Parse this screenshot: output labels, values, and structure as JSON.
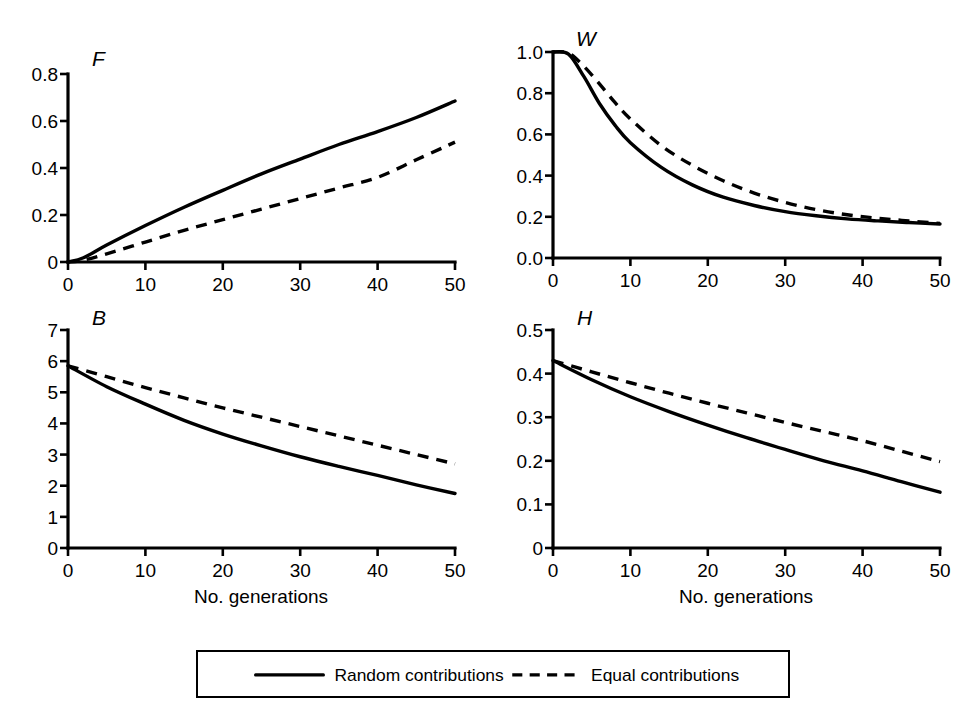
{
  "figure": {
    "background": "#ffffff",
    "ink_color": "#000000",
    "xlabel": "No. generations"
  },
  "legend": {
    "entries": [
      {
        "label": "Random contributions",
        "style": "solid",
        "marker": "solid-line-swatch"
      },
      {
        "label": "Equal contributions",
        "style": "dashed",
        "marker": "dashed-line-swatch"
      }
    ]
  },
  "chart_data": [
    {
      "id": "panel-F",
      "type": "line",
      "title": "F",
      "panel_letter": "F",
      "xlabel": "",
      "ylabel": "",
      "xlim": [
        0,
        50
      ],
      "ylim": [
        0,
        0.8
      ],
      "xticks": [
        0,
        10,
        20,
        30,
        40,
        50
      ],
      "yticks": [
        0,
        0.2,
        0.4,
        0.6,
        0.8
      ],
      "xticklabels": [
        "0",
        "10",
        "20",
        "30",
        "40",
        "50"
      ],
      "yticklabels": [
        "0",
        "0.2",
        "0.4",
        "0.6",
        "0.8"
      ],
      "grid": false,
      "legend_position": "below-figure",
      "x": [
        0,
        2,
        5,
        10,
        15,
        20,
        25,
        30,
        35,
        40,
        45,
        50
      ],
      "series": [
        {
          "name": "Random contributions",
          "style": "solid",
          "values": [
            0.0,
            0.018,
            0.072,
            0.155,
            0.233,
            0.305,
            0.375,
            0.438,
            0.5,
            0.555,
            0.615,
            0.685
          ]
        },
        {
          "name": "Equal contributions",
          "style": "dashed",
          "values": [
            0.0,
            0.008,
            0.035,
            0.085,
            0.135,
            0.18,
            0.225,
            0.27,
            0.315,
            0.36,
            0.435,
            0.51
          ]
        }
      ]
    },
    {
      "id": "panel-W",
      "type": "line",
      "title": "W",
      "panel_letter": "W",
      "xlabel": "",
      "ylabel": "",
      "xlim": [
        0,
        50
      ],
      "ylim": [
        0,
        1.0
      ],
      "xticks": [
        0,
        10,
        20,
        30,
        40,
        50
      ],
      "yticks": [
        0.0,
        0.2,
        0.4,
        0.6,
        0.8,
        1.0
      ],
      "xticklabels": [
        "0",
        "10",
        "20",
        "30",
        "40",
        "50"
      ],
      "yticklabels": [
        "0.0",
        "0.2",
        "0.4",
        "0.6",
        "0.8",
        "1.0"
      ],
      "grid": false,
      "legend_position": "below-figure",
      "x": [
        0,
        2,
        4,
        6,
        8,
        10,
        14,
        18,
        22,
        26,
        30,
        34,
        38,
        42,
        46,
        50
      ],
      "series": [
        {
          "name": "Random contributions",
          "style": "solid",
          "values": [
            1.0,
            0.99,
            0.88,
            0.75,
            0.645,
            0.56,
            0.44,
            0.355,
            0.295,
            0.255,
            0.225,
            0.205,
            0.19,
            0.18,
            0.172,
            0.165
          ]
        },
        {
          "name": "Equal contributions",
          "style": "dashed",
          "values": [
            1.0,
            0.995,
            0.93,
            0.845,
            0.755,
            0.675,
            0.545,
            0.45,
            0.375,
            0.315,
            0.27,
            0.235,
            0.21,
            0.193,
            0.18,
            0.168
          ]
        }
      ]
    },
    {
      "id": "panel-B",
      "type": "line",
      "title": "B",
      "panel_letter": "B",
      "xlabel": "No. generations",
      "ylabel": "",
      "xlim": [
        0,
        50
      ],
      "ylim": [
        0,
        7
      ],
      "xticks": [
        0,
        10,
        20,
        30,
        40,
        50
      ],
      "yticks": [
        0,
        1,
        2,
        3,
        4,
        5,
        6,
        7
      ],
      "xticklabels": [
        "0",
        "10",
        "20",
        "30",
        "40",
        "50"
      ],
      "yticklabels": [
        "0",
        "1",
        "2",
        "3",
        "4",
        "5",
        "6",
        "7"
      ],
      "grid": false,
      "legend_position": "below-figure",
      "x": [
        0,
        5,
        10,
        15,
        20,
        25,
        30,
        35,
        40,
        45,
        50
      ],
      "series": [
        {
          "name": "Random contributions",
          "style": "solid",
          "values": [
            5.85,
            5.18,
            4.62,
            4.1,
            3.66,
            3.28,
            2.93,
            2.62,
            2.33,
            2.03,
            1.75
          ]
        },
        {
          "name": "Equal contributions",
          "style": "dashed",
          "values": [
            5.85,
            5.5,
            5.15,
            4.82,
            4.5,
            4.2,
            3.9,
            3.6,
            3.3,
            3.0,
            2.7
          ]
        }
      ]
    },
    {
      "id": "panel-H",
      "type": "line",
      "title": "H",
      "panel_letter": "H",
      "xlabel": "No. generations",
      "ylabel": "",
      "xlim": [
        0,
        50
      ],
      "ylim": [
        0,
        0.5
      ],
      "xticks": [
        0,
        10,
        20,
        30,
        40,
        50
      ],
      "yticks": [
        0,
        0.1,
        0.2,
        0.3,
        0.4,
        0.5
      ],
      "xticklabels": [
        "0",
        "10",
        "20",
        "30",
        "40",
        "50"
      ],
      "yticklabels": [
        "0",
        "0.1",
        "0.2",
        "0.3",
        "0.4",
        "0.5"
      ],
      "grid": false,
      "legend_position": "below-figure",
      "x": [
        0,
        5,
        10,
        15,
        20,
        25,
        30,
        35,
        40,
        45,
        50
      ],
      "series": [
        {
          "name": "Random contributions",
          "style": "solid",
          "values": [
            0.43,
            0.386,
            0.347,
            0.313,
            0.282,
            0.253,
            0.226,
            0.2,
            0.177,
            0.152,
            0.128
          ]
        },
        {
          "name": "Equal contributions",
          "style": "dashed",
          "values": [
            0.43,
            0.404,
            0.379,
            0.355,
            0.332,
            0.31,
            0.288,
            0.267,
            0.246,
            0.222,
            0.198
          ]
        }
      ]
    }
  ]
}
